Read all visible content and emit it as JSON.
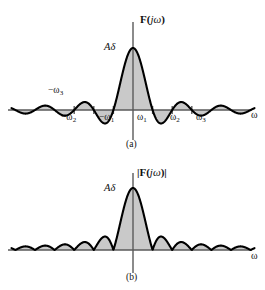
{
  "figure": {
    "background_color": "#ffffff",
    "curve_color": "#000000",
    "fill_color": "#c9c9c9",
    "axis_color": "#4a4a4a"
  },
  "panel_a": {
    "caption": "(a)",
    "axis_name_bold": "F",
    "axis_name_rest_open": "(",
    "axis_name_j": "j",
    "axis_name_omega": "ω",
    "axis_name_rest_close": ")",
    "amplitude_label_A": "A",
    "amplitude_label_delta": "δ",
    "x_axis_label": "ω",
    "ticks": [
      {
        "label_prefix": "−",
        "label_omega": "ω",
        "label_sub": "3",
        "side": "left",
        "index": 3
      },
      {
        "label_prefix": "−",
        "label_omega": "ω",
        "label_sub": "2",
        "side": "left",
        "index": 2
      },
      {
        "label_prefix": "−",
        "label_omega": "ω",
        "label_sub": "1",
        "side": "left",
        "index": 1
      },
      {
        "label_prefix": "",
        "label_omega": "ω",
        "label_sub": "1",
        "side": "right",
        "index": 1
      },
      {
        "label_prefix": "",
        "label_omega": "ω",
        "label_sub": "2",
        "side": "right",
        "index": 2
      },
      {
        "label_prefix": "",
        "label_omega": "ω",
        "label_sub": "3",
        "side": "right",
        "index": 3
      }
    ]
  },
  "panel_b": {
    "caption": "(b)",
    "axis_name_bar_open": "|",
    "axis_name_bold": "F",
    "axis_name_rest_open": "(",
    "axis_name_j": "j",
    "axis_name_omega": "ω",
    "axis_name_rest_close": ")",
    "axis_name_bar_close": "|",
    "amplitude_label_A": "A",
    "amplitude_label_delta": "δ",
    "x_axis_label": "ω"
  },
  "chart_data": [
    {
      "type": "line",
      "id": "panel-a",
      "title": "F(jω)",
      "subtitle": "(a)",
      "xlabel": "ω",
      "ylabel": "F(jω)",
      "description": "Sinc function: Fourier transform of a rectangular pulse, showing signed sidelobes above and below the ω axis. Area under curve shaded gray.",
      "function": "Aδ * sin(ωδ/2)/(ωδ/2)",
      "peak_value_label": "Aδ",
      "peak_value": 1.0,
      "zero_crossings": [
        "-ω₃",
        "-ω₂",
        "-ω₁",
        "ω₁",
        "ω₂",
        "ω₃"
      ],
      "xtick_labels": [
        "−ω₃",
        "−ω₂",
        "−ω₁",
        "ω₁",
        "ω₂",
        "ω₃"
      ],
      "xtick_values": [
        -3,
        -2,
        -1,
        1,
        2,
        3
      ],
      "xlim": [
        -6.2,
        6.2
      ],
      "ylim": [
        -0.3,
        1.12
      ],
      "grid": false,
      "legend": false,
      "fill": "to-zero",
      "sidelobe_peaks": [
        {
          "x": -5.5,
          "y": 0.055
        },
        {
          "x": -4.5,
          "y": -0.072
        },
        {
          "x": -3.5,
          "y": 0.091
        },
        {
          "x": -2.5,
          "y": -0.128
        },
        {
          "x": -1.5,
          "y": 0.217
        },
        {
          "x": 1.5,
          "y": 0.217
        },
        {
          "x": 2.5,
          "y": -0.128
        },
        {
          "x": 3.5,
          "y": 0.091
        },
        {
          "x": 4.5,
          "y": -0.072
        },
        {
          "x": 5.5,
          "y": 0.055
        }
      ]
    },
    {
      "type": "line",
      "id": "panel-b",
      "title": "|F(jω)|",
      "subtitle": "(b)",
      "xlabel": "ω",
      "ylabel": "|F(jω)|",
      "description": "Magnitude spectrum: absolute value of the sinc function, all lobes rectified above the ω axis. Area under curve shaded gray.",
      "function": "|Aδ * sin(ωδ/2)/(ωδ/2)|",
      "peak_value_label": "Aδ",
      "peak_value": 1.0,
      "xlim": [
        -6.2,
        6.2
      ],
      "ylim": [
        0,
        1.12
      ],
      "grid": false,
      "legend": false,
      "fill": "to-zero",
      "xtick_labels": [],
      "sidelobe_peaks": [
        {
          "x": -5.5,
          "y": 0.055
        },
        {
          "x": -4.5,
          "y": 0.072
        },
        {
          "x": -3.5,
          "y": 0.091
        },
        {
          "x": -2.5,
          "y": 0.128
        },
        {
          "x": -1.5,
          "y": 0.217
        },
        {
          "x": 1.5,
          "y": 0.217
        },
        {
          "x": 2.5,
          "y": 0.128
        },
        {
          "x": 3.5,
          "y": 0.091
        },
        {
          "x": 4.5,
          "y": 0.072
        },
        {
          "x": 5.5,
          "y": 0.055
        }
      ]
    }
  ]
}
